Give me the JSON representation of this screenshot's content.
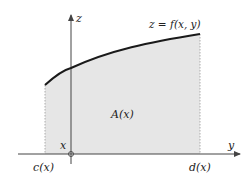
{
  "diagram": {
    "title": "",
    "axes": {
      "vertical_label": "z",
      "horizontal_label": "y"
    },
    "curve_label": "z = f(x, y)",
    "region_label": "A(x)",
    "origin_label": "x",
    "left_bound_label": "c(x)",
    "right_bound_label": "d(x)",
    "colors": {
      "region_fill": "#e6e6e6",
      "curve": "#1a1a1a",
      "axis": "#444444",
      "bound_lines": "#9a9a9a"
    }
  }
}
